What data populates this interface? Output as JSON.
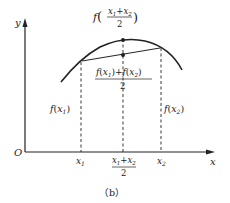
{
  "figure": {
    "caption": "（b）",
    "axes": {
      "x_label": "x",
      "y_label": "y",
      "origin_label": "O"
    },
    "x_ticks": {
      "x1": "x1",
      "mid_num": "x1+x2",
      "mid_den": "2",
      "x2": "x2"
    },
    "labels": {
      "f_of_mean_prefix": "f",
      "f_of_mean_num": "x1+x2",
      "f_of_mean_den": "2",
      "mean_of_f_num": "f(x1)+f(x2)",
      "mean_of_f_den": "2",
      "f_x1": "f(x1)",
      "f_x2": "f(x2)"
    },
    "colors": {
      "stroke": "#222222",
      "background": "#ffffff"
    }
  }
}
